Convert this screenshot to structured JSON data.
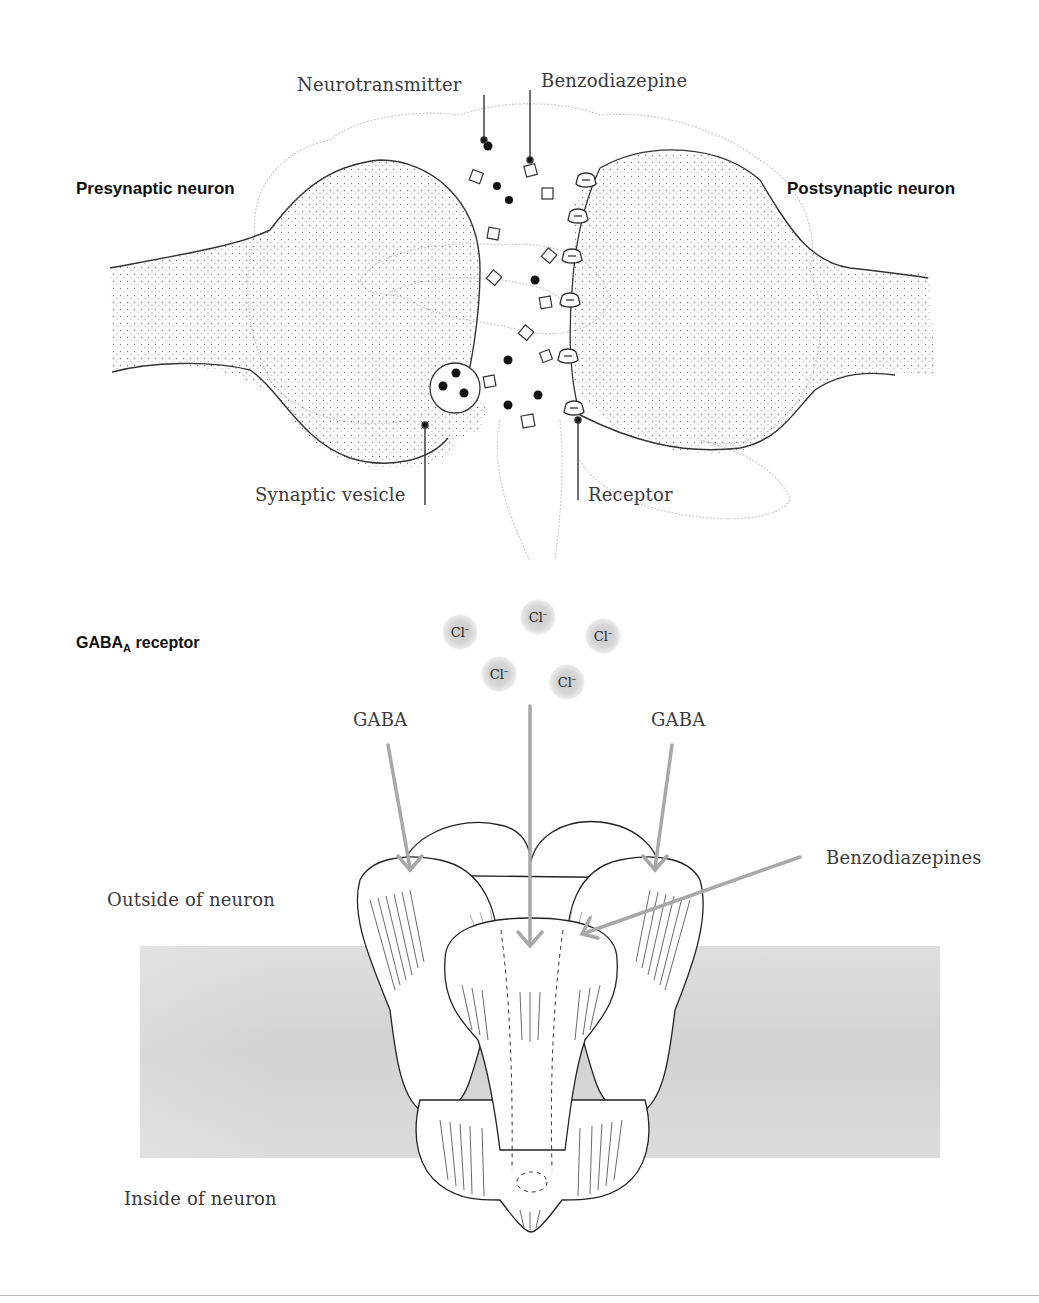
{
  "synapse": {
    "title_left": "Presynaptic neuron",
    "title_right": "Postsynaptic neuron",
    "labels": {
      "neurotransmitter": "Neurotransmitter",
      "benzodiazepine": "Benzodiazepine",
      "synaptic_vesicle": "Synaptic vesicle",
      "receptor": "Receptor"
    }
  },
  "receptor_diagram": {
    "title_main": "GABA",
    "title_sub": "A",
    "title_rest": " receptor",
    "ions": [
      {
        "symbol": "Cl",
        "charge": "–"
      },
      {
        "symbol": "Cl",
        "charge": "–"
      },
      {
        "symbol": "Cl",
        "charge": "–"
      },
      {
        "symbol": "Cl",
        "charge": "–"
      },
      {
        "symbol": "Cl",
        "charge": "–"
      }
    ],
    "labels": {
      "gaba_left": "GABA",
      "gaba_right": "GABA",
      "benzodiazepines": "Benzodiazepines",
      "outside": "Outside of neuron",
      "inside": "Inside of neuron"
    }
  },
  "colors": {
    "line": "#333333",
    "arrow": "#a8a8a8",
    "membrane": "#dcdcdc",
    "brain_outline": "#c8c8c8"
  }
}
